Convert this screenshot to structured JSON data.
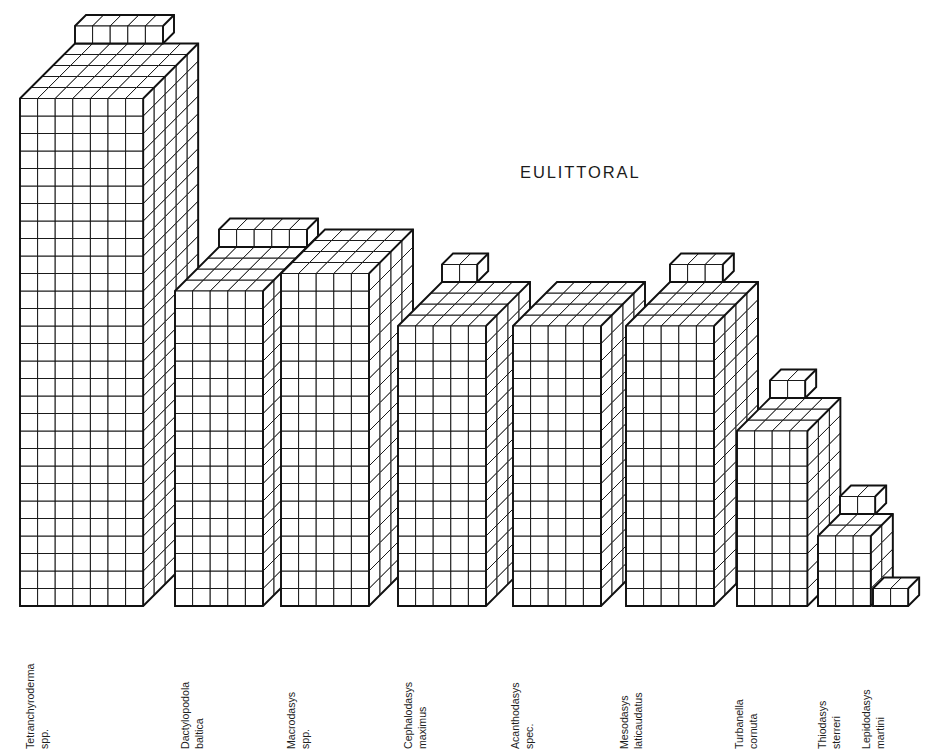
{
  "chart_data": {
    "type": "bar",
    "title": "EULITTORAL",
    "xlabel": "",
    "ylabel": "",
    "grid": false,
    "legend": null,
    "render_style": "isometric-unit-cube-3d",
    "unit_note": "each bar is built of unit cubes; value = number of cube layers (front rows)",
    "cube": {
      "front_w": 17.6,
      "front_h": 17.5,
      "depth_dx": 11.0,
      "depth_dy": -11.0
    },
    "axis_baseline_y": 606,
    "ylim": [
      0,
      30
    ],
    "categories": [
      "Tetranchyroderma spp.",
      "Dactylopodola baltica",
      "Macrodasys spp.",
      "Cephalodasys maximus",
      "Acanthodasys spec.",
      "Mesodasys laticaudatus",
      "Turbanella cornuta",
      "Thiodasys sterreri",
      "Lepidodasys martini"
    ],
    "values": [
      30,
      19,
      19,
      18,
      17,
      17,
      11,
      5,
      1
    ],
    "bars": [
      {
        "label_line1": "Tetranchyroderma",
        "label_line2": "spp.",
        "x": 20,
        "cols": 7,
        "rows": 29,
        "depth": 5,
        "cap_cols": 5,
        "cap_rows": 1,
        "label_x": 36
      },
      {
        "label_line1": "Dactylopodola",
        "label_line2": "baltica",
        "x": 175,
        "cols": 5,
        "rows": 18,
        "depth": 4,
        "cap_cols": 5,
        "cap_rows": 1,
        "label_x": 191
      },
      {
        "label_line1": "Macrodasys",
        "label_line2": "spp.",
        "x": 281,
        "cols": 5,
        "rows": 19,
        "depth": 4,
        "cap_cols": 0,
        "cap_rows": 0,
        "label_x": 297
      },
      {
        "label_line1": "Cephalodasys",
        "label_line2": "maximus",
        "x": 398,
        "cols": 5,
        "rows": 16,
        "depth": 4,
        "cap_cols": 2,
        "cap_rows": 1,
        "label_x": 414
      },
      {
        "label_line1": "Acanthodasys",
        "label_line2": "spec.",
        "x": 513,
        "cols": 5,
        "rows": 16,
        "depth": 4,
        "cap_cols": 0,
        "cap_rows": 0,
        "label_x": 521
      },
      {
        "label_line1": "Mesodasys",
        "label_line2": "laticaudatus",
        "x": 626,
        "cols": 5,
        "rows": 16,
        "depth": 4,
        "cap_cols": 3,
        "cap_rows": 1,
        "label_x": 630
      },
      {
        "label_line1": "Turbanella",
        "label_line2": "cornuta",
        "x": 737,
        "cols": 4,
        "rows": 10,
        "depth": 3,
        "cap_cols": 2,
        "cap_rows": 1,
        "label_x": 745
      },
      {
        "label_line1": "Thiodasys",
        "label_line2": "sterreri",
        "x": 818,
        "cols": 3,
        "rows": 4,
        "depth": 2,
        "cap_cols": 2,
        "cap_rows": 1,
        "label_x": 828
      },
      {
        "label_line1": "Lepidodasys",
        "label_line2": "martini",
        "x": 873,
        "cols": 2,
        "rows": 1,
        "depth": 1,
        "cap_cols": 0,
        "cap_rows": 0,
        "label_x": 872
      }
    ]
  },
  "figure": {
    "title": "EULITTORAL",
    "background": "#ffffff",
    "line_color": "#111111"
  }
}
